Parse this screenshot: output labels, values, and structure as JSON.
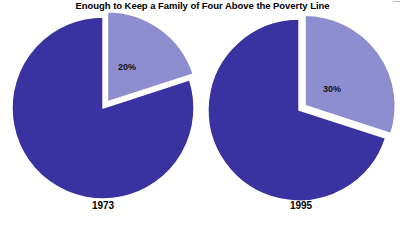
{
  "chart_data": {
    "type": "pie",
    "title": "Enough to Keep a Family of Four Above the Poverty Line",
    "xlabel": "",
    "ylabel": "",
    "legend": "none",
    "grid": false,
    "charts": [
      {
        "name": "1973",
        "year_label": "1973",
        "categories": [
          "Above the Poverty Line",
          "Below the Poverty Line"
        ],
        "values": [
          20,
          80
        ],
        "data_labels": [
          "20%",
          ""
        ],
        "highlighted_label": "20%",
        "highlighted_value": 20,
        "exploded_slice_index": 0,
        "start_angle_deg": 0,
        "direction": "clockwise"
      },
      {
        "name": "1995",
        "year_label": "1995",
        "categories": [
          "Above the Poverty Line",
          "Below the Poverty Line"
        ],
        "values": [
          30,
          70
        ],
        "data_labels": [
          "30%",
          ""
        ],
        "highlighted_label": "30%",
        "highlighted_value": 30,
        "exploded_slice_index": 0,
        "start_angle_deg": 0,
        "direction": "clockwise"
      }
    ],
    "colors": {
      "slice_light": "#8d8dd0",
      "slice_dark": "#3a32a0",
      "background": "#ffffff",
      "separator": "#ffffff",
      "text": "#000000"
    }
  },
  "figure": {
    "title": "Enough to Keep a Family of Four Above the Poverty Line",
    "pie_1973": {
      "percent_label": "20%",
      "year_label": "1973"
    },
    "pie_1995": {
      "percent_label": "30%",
      "year_label": "1995"
    }
  }
}
